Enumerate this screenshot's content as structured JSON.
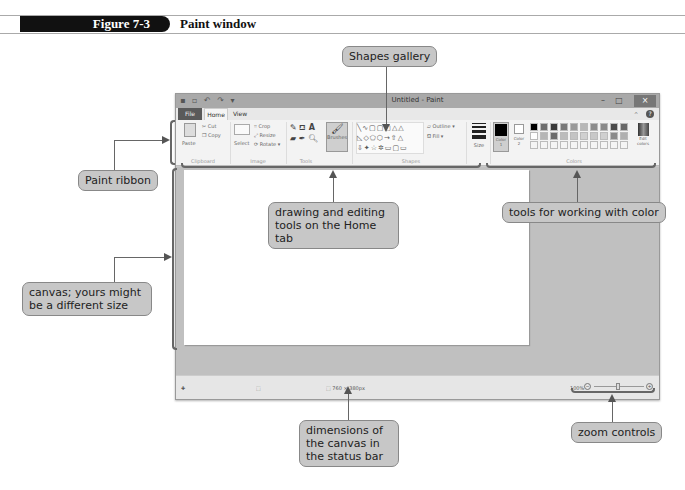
{
  "figure": {
    "number": "Figure 7-3",
    "title": "Paint window"
  },
  "window": {
    "title": "Untitled - Paint",
    "controls": {
      "minimize": "–",
      "maximize": "□",
      "close": "×"
    }
  },
  "tabs": [
    {
      "label": "File"
    },
    {
      "label": "Home",
      "active": true
    },
    {
      "label": "View"
    }
  ],
  "ribbon": {
    "groups": [
      {
        "name": "Clipboard",
        "items": [
          "Paste",
          "Cut",
          "Copy"
        ]
      },
      {
        "name": "Image",
        "items": [
          "Select",
          "Crop",
          "Resize",
          "Rotate"
        ]
      },
      {
        "name": "Tools",
        "items": [
          "Pencil",
          "Fill",
          "Text",
          "Eraser",
          "Color picker",
          "Magnifier"
        ]
      },
      {
        "name": "Brushes",
        "items": [
          "Brushes"
        ]
      },
      {
        "name": "Shapes",
        "items": [
          "Outline",
          "Fill"
        ]
      },
      {
        "name": "Size",
        "items": [
          "Size"
        ]
      },
      {
        "name": "Colors",
        "items": [
          "Color 1",
          "Color 2",
          "Edit colors"
        ]
      }
    ],
    "labels": {
      "paste": "Paste",
      "cut": "Cut",
      "copy": "Copy",
      "select": "Select",
      "crop": "Crop",
      "resize": "Resize",
      "rotate": "Rotate ▾",
      "brushes": "Brushes",
      "outline": "Outline ▾",
      "fill": "Fill ▾",
      "size": "Size",
      "color1": "Color 1",
      "color2": "Color 2",
      "edit_colors": "Edit colors",
      "clipboard": "Clipboard",
      "image": "Image",
      "tools": "Tools",
      "shapes": "Shapes",
      "colors": "Colors"
    },
    "shapes_row1": "╲∿▢▢▢△△",
    "shapes_row2": "◺◇⬠⬡→⇧△",
    "shapes_row3": "⇩✦☆✲▭▢▭",
    "palette_top": [
      "#000000",
      "#6e6e6e",
      "#3a3a3a",
      "#7a7a7a",
      "#9a9a9a",
      "#b8b8b8",
      "#8c8c8c",
      "#8a8a8a",
      "#4a4a4a",
      "#6a6a6a"
    ],
    "palette_mid": [
      "#ffffff",
      "#b5b5b5",
      "#6c6c6c",
      "#bcbcbc",
      "#c4c4c4",
      "#d0d0d0",
      "#c8c8c8",
      "#cfcfcf",
      "#8a8a8a",
      "#b0b0b0"
    ]
  },
  "status": {
    "cursor_position": "",
    "selection_size": "",
    "canvas_size": "760 × 380px",
    "zoom_level": "100%"
  },
  "callouts": {
    "shapes_gallery": "Shapes gallery",
    "paint_ribbon": "Paint ribbon",
    "canvas": "canvas; yours might be a different size",
    "drawing_tools": "drawing and editing tools on the Home tab",
    "color_tools": "tools for working with color",
    "canvas_dimensions": "dimensions of the canvas in the status bar",
    "zoom_controls": "zoom controls"
  }
}
